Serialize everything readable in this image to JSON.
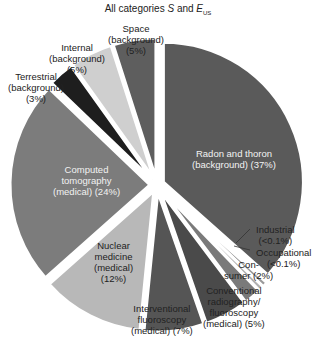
{
  "chart_data": {
    "type": "pie",
    "title_parts": {
      "prefix": "All categories ",
      "s": "S",
      "and": " and ",
      "e": "E",
      "sub": "US"
    },
    "exploded": true,
    "start_angle": "12 o'clock",
    "direction": "clockwise",
    "slices": [
      {
        "key": "radon",
        "label": "Radon and thoron (background)",
        "value": 37,
        "display": "37%",
        "color": "#5a5a5a"
      },
      {
        "key": "industrial",
        "label": "Industrial",
        "value": 0.1,
        "display": "<0.1%",
        "color": "#9a9a9a"
      },
      {
        "key": "occupational",
        "label": "Occupational",
        "value": 0.1,
        "display": "<0.1%",
        "color": "#b0b0b0"
      },
      {
        "key": "consumer",
        "label": "Consumer",
        "value": 2,
        "display": "2%",
        "color": "#7a7a7a"
      },
      {
        "key": "conventional",
        "label": "Conventional radiography/ fluoroscopy (medical)",
        "value": 5,
        "display": "5%",
        "color": "#4a4a4a"
      },
      {
        "key": "interventional",
        "label": "Interventional fluoroscopy (medical)",
        "value": 7,
        "display": "7%",
        "color": "#555555"
      },
      {
        "key": "nuclear",
        "label": "Nuclear medicine (medical)",
        "value": 12,
        "display": "12%",
        "color": "#b8b8b8"
      },
      {
        "key": "ct",
        "label": "Computed tomography (medical)",
        "value": 24,
        "display": "24%",
        "color": "#7c7c7c"
      },
      {
        "key": "terrestrial",
        "label": "Terrestrial (background)",
        "value": 3,
        "display": "3%",
        "color": "#1e1e1e"
      },
      {
        "key": "internal",
        "label": "Internal (background)",
        "value": 5,
        "display": "5%",
        "color": "#cfcfcf"
      },
      {
        "key": "space",
        "label": "Space (background)",
        "value": 5,
        "display": "5%",
        "color": "#5e5e5e"
      }
    ]
  },
  "labels": {
    "radon": [
      "Radon and thoron",
      "(background) (37%)"
    ],
    "industrial": [
      "Industrial",
      "(<0.1%)"
    ],
    "occupational": [
      "Occupational",
      "(<0.1%)"
    ],
    "consumer": [
      "Con-",
      "sumer (2%)"
    ],
    "conventional": [
      "Conventional",
      "radiography/",
      "fluoroscopy",
      "(medical) (5%)"
    ],
    "interventional": [
      "Interventional",
      "fluoroscopy",
      "(medical) (7%)"
    ],
    "nuclear": [
      "Nuclear",
      "medicine",
      "(medical)",
      "(12%)"
    ],
    "ct": [
      "Computed",
      "tomography",
      "(medical) (24%)"
    ],
    "terrestrial": [
      "Terrestrial",
      "(background)",
      "(3%)"
    ],
    "internal": [
      "Internal",
      "(background)",
      "(5%)"
    ],
    "space": [
      "Space",
      "(background)",
      "(5%)"
    ]
  }
}
